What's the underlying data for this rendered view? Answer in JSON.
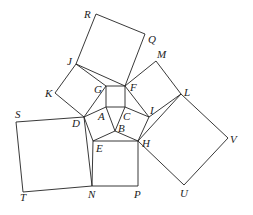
{
  "figure": {
    "points": {
      "R": [
        96,
        14
      ],
      "Q": [
        145,
        34
      ],
      "J": [
        76,
        64
      ],
      "M": [
        156,
        61
      ],
      "K": [
        55,
        93
      ],
      "G": [
        106,
        86
      ],
      "F": [
        125,
        86
      ],
      "L": [
        181,
        94
      ],
      "A": [
        106,
        107
      ],
      "C": [
        125,
        107
      ],
      "I": [
        149,
        117
      ],
      "S": [
        16,
        122
      ],
      "D": [
        84,
        117
      ],
      "B": [
        115,
        131
      ],
      "E": [
        93,
        141
      ],
      "H": [
        138,
        141
      ],
      "V": [
        228,
        138
      ],
      "T": [
        23,
        192
      ],
      "N": [
        92,
        186
      ],
      "P": [
        138,
        186
      ],
      "U": [
        184,
        185
      ]
    },
    "segments": [
      [
        "R",
        "Q"
      ],
      [
        "Q",
        "F"
      ],
      [
        "F",
        "J"
      ],
      [
        "J",
        "R"
      ],
      [
        "J",
        "K"
      ],
      [
        "K",
        "D"
      ],
      [
        "D",
        "G"
      ],
      [
        "G",
        "J"
      ],
      [
        "F",
        "M"
      ],
      [
        "M",
        "L"
      ],
      [
        "L",
        "I"
      ],
      [
        "I",
        "F"
      ],
      [
        "L",
        "V"
      ],
      [
        "V",
        "U"
      ],
      [
        "U",
        "H"
      ],
      [
        "H",
        "L"
      ],
      [
        "S",
        "D"
      ],
      [
        "D",
        "N"
      ],
      [
        "N",
        "T"
      ],
      [
        "T",
        "S"
      ],
      [
        "E",
        "H"
      ],
      [
        "H",
        "P"
      ],
      [
        "P",
        "N"
      ],
      [
        "N",
        "E"
      ],
      [
        "G",
        "F"
      ],
      [
        "F",
        "C"
      ],
      [
        "C",
        "A"
      ],
      [
        "A",
        "G"
      ],
      [
        "A",
        "D"
      ],
      [
        "D",
        "E"
      ],
      [
        "E",
        "B"
      ],
      [
        "B",
        "A"
      ],
      [
        "B",
        "C"
      ],
      [
        "C",
        "I"
      ],
      [
        "I",
        "H"
      ],
      [
        "H",
        "B"
      ]
    ],
    "labels": [
      {
        "text": "R",
        "x": 84,
        "y": 18
      },
      {
        "text": "Q",
        "x": 148,
        "y": 43
      },
      {
        "text": "J",
        "x": 67,
        "y": 65
      },
      {
        "text": "M",
        "x": 157,
        "y": 58
      },
      {
        "text": "K",
        "x": 45,
        "y": 97
      },
      {
        "text": "G",
        "x": 94,
        "y": 93
      },
      {
        "text": "F",
        "x": 130,
        "y": 91
      },
      {
        "text": "L",
        "x": 184,
        "y": 96
      },
      {
        "text": "A",
        "x": 98,
        "y": 120
      },
      {
        "text": "C",
        "x": 123,
        "y": 120
      },
      {
        "text": "I",
        "x": 150,
        "y": 114
      },
      {
        "text": "S",
        "x": 15,
        "y": 118
      },
      {
        "text": "D",
        "x": 72,
        "y": 127
      },
      {
        "text": "B",
        "x": 118,
        "y": 132
      },
      {
        "text": "E",
        "x": 96,
        "y": 152
      },
      {
        "text": "H",
        "x": 142,
        "y": 147
      },
      {
        "text": "V",
        "x": 230,
        "y": 143
      },
      {
        "text": "T",
        "x": 20,
        "y": 201
      },
      {
        "text": "N",
        "x": 88,
        "y": 198
      },
      {
        "text": "P",
        "x": 134,
        "y": 198
      },
      {
        "text": "U",
        "x": 180,
        "y": 197
      }
    ]
  }
}
